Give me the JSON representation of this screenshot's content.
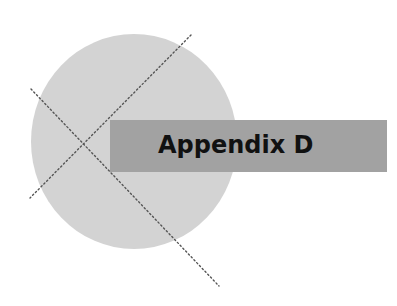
{
  "heading": {
    "title": "Appendix D"
  },
  "colors": {
    "circle": "#d3d3d3",
    "banner": "#a2a2a2",
    "text": "#111111",
    "dotted_lines": "#555555",
    "background": "#ffffff"
  }
}
